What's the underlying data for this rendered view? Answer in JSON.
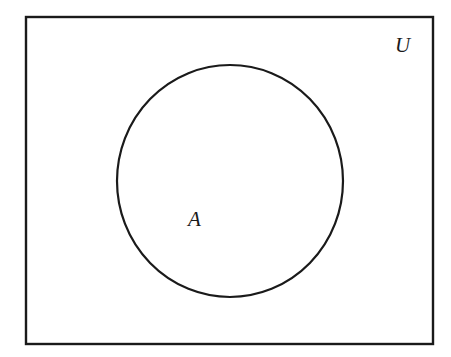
{
  "diagram": {
    "type": "venn",
    "universe": {
      "label": "U",
      "x": 26,
      "y": 17,
      "width": 407,
      "height": 327,
      "label_x": 395,
      "label_y": 52
    },
    "sets": [
      {
        "label": "A",
        "cx": 230,
        "cy": 181,
        "rx": 113,
        "ry": 116,
        "label_x": 188,
        "label_y": 226
      }
    ],
    "colors": {
      "stroke": "#1a1a1a",
      "background": "#ffffff"
    }
  }
}
